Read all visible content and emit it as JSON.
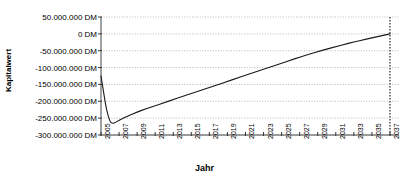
{
  "chart_data": {
    "type": "line",
    "title": "",
    "xlabel": "Jahr",
    "ylabel": "Kapitalwert",
    "xlim": [
      2005,
      2038
    ],
    "ylim": [
      -300000000,
      50000000
    ],
    "grid": true,
    "legend": "none",
    "y_tick_labels": [
      "50.000.000 DM",
      "0 DM",
      "-50.000.000 DM",
      "-100.000.000 DM",
      "-150.000.000 DM",
      "-200.000.000 DM",
      "-250.000.000 DM",
      "-300.000.000 DM"
    ],
    "y_tick_values": [
      50000000,
      0,
      -50000000,
      -100000000,
      -150000000,
      -200000000,
      -250000000,
      -300000000
    ],
    "x_tick_labels": [
      "2005",
      "2007",
      "2009",
      "2011",
      "2013",
      "2015",
      "2017",
      "2019",
      "2021",
      "2023",
      "2025",
      "2027",
      "2029",
      "2031",
      "2033",
      "2035",
      "2037"
    ],
    "x_tick_values": [
      2005,
      2007,
      2009,
      2011,
      2013,
      2015,
      2017,
      2019,
      2021,
      2023,
      2025,
      2027,
      2029,
      2031,
      2033,
      2035,
      2037
    ],
    "annotations": [
      {
        "name": "breakeven-marker",
        "type": "vertical-dotted-line",
        "x": 2037,
        "label": ""
      }
    ],
    "series": [
      {
        "name": "Kapitalwert",
        "color": "#1a1a1a",
        "x": [
          2005,
          2005.3,
          2005.6,
          2006.0,
          2006.3,
          2006.6,
          2007.0,
          2008,
          2009,
          2010,
          2011,
          2012,
          2013,
          2014,
          2015,
          2016,
          2017,
          2018,
          2019,
          2020,
          2021,
          2022,
          2023,
          2024,
          2025,
          2026,
          2027,
          2028,
          2029,
          2030,
          2031,
          2032,
          2033,
          2034,
          2035,
          2036,
          2037
        ],
        "values": [
          -125000000,
          -175000000,
          -225000000,
          -262000000,
          -266000000,
          -263000000,
          -256000000,
          -243000000,
          -232000000,
          -222000000,
          -213000000,
          -204000000,
          -195000000,
          -186000000,
          -177000000,
          -168000000,
          -159000000,
          -150000000,
          -141000000,
          -132000000,
          -123000000,
          -114000000,
          -105000000,
          -96000000,
          -87000000,
          -78000000,
          -69000000,
          -61000000,
          -53000000,
          -45000000,
          -38000000,
          -31000000,
          -24000000,
          -18000000,
          -12000000,
          -6000000,
          0
        ]
      }
    ]
  }
}
